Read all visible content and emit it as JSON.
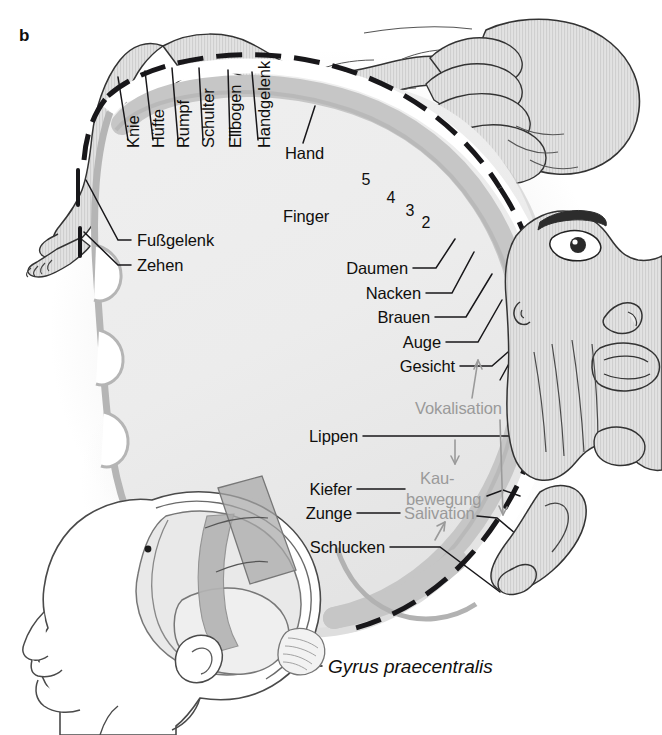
{
  "figure": {
    "panel_letter": "b",
    "caption_label": "Gyrus praecentralis",
    "colors": {
      "ink": "#100f0d",
      "gray_text": "#9a9a9a",
      "cortex_band": "#c6c6c6",
      "cortex_interior": "#ededed",
      "body_fill": "#dcdcdc",
      "shadow": "#b8b8b8",
      "background": "#ffffff"
    }
  },
  "vertical_labels": [
    {
      "text": "Knie",
      "x": 125,
      "y": 148
    },
    {
      "text": "Hüfte",
      "x": 150,
      "y": 148
    },
    {
      "text": "Rumpf",
      "x": 175,
      "y": 148
    },
    {
      "text": "Schulter",
      "x": 200,
      "y": 148
    },
    {
      "text": "Ellbogen",
      "x": 227,
      "y": 148
    },
    {
      "text": "Handgelenk",
      "x": 256,
      "y": 148
    }
  ],
  "left_labels": [
    {
      "text": "Fußgelenk",
      "x": 127,
      "y": 240
    },
    {
      "text": "Zehen",
      "x": 127,
      "y": 265
    }
  ],
  "plain_labels": [
    {
      "text": "Hand",
      "x": 285,
      "y": 153
    },
    {
      "text": "Finger",
      "x": 283,
      "y": 216
    }
  ],
  "finger_numbers": [
    {
      "text": "5",
      "x": 366,
      "y": 180
    },
    {
      "text": "4",
      "x": 391,
      "y": 198
    },
    {
      "text": "3",
      "x": 410,
      "y": 211
    },
    {
      "text": "2",
      "x": 426,
      "y": 223
    }
  ],
  "right_labels": [
    {
      "text": "Daumen",
      "x": 408,
      "y": 268
    },
    {
      "text": "Nacken",
      "x": 421,
      "y": 293
    },
    {
      "text": "Brauen",
      "x": 430,
      "y": 317
    },
    {
      "text": "Auge",
      "x": 441,
      "y": 342
    },
    {
      "text": "Gesicht",
      "x": 455,
      "y": 366
    },
    {
      "text": "Lippen",
      "x": 358,
      "y": 436
    },
    {
      "text": "Kiefer",
      "x": 352,
      "y": 489
    },
    {
      "text": "Zunge",
      "x": 352,
      "y": 513
    },
    {
      "text": "Schlucken",
      "x": 385,
      "y": 547
    }
  ],
  "gray_labels": [
    {
      "text": "Vokalisation",
      "x": 415,
      "y": 408
    },
    {
      "text": "Kau-",
      "x": 420,
      "y": 478
    },
    {
      "text": "bewegung",
      "x": 420,
      "y": 499
    },
    {
      "text": "Salivation",
      "x": 410,
      "y": 513
    }
  ],
  "icons": {
    "homunculus_body": "homunculus-body-icon",
    "homunculus_hand": "homunculus-hand-icon",
    "homunculus_face": "homunculus-face-icon",
    "homunculus_tongue": "homunculus-tongue-icon",
    "brain_head": "brain-head-profile-icon",
    "cortex_section": "cortex-cross-section-icon",
    "motor_strip": "precentral-gyrus-strip-icon"
  }
}
